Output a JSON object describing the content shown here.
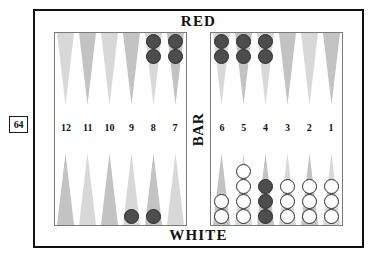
{
  "doubling_cube": {
    "value": "64",
    "name": "doubling-cube"
  },
  "frame": {
    "top_player_label": "RED",
    "bottom_player_label": "WHITE",
    "bar_label": "BAR"
  },
  "colors": {
    "red_checker": "#4d4d4d",
    "white_checker": "#ffffff",
    "checker_outline": "#2b2b2b",
    "point_light": "#d8d8d8",
    "point_dark": "#c3c3c3",
    "frame_border": "#111111",
    "board_border": "#7a7a7a",
    "background": "#ffffff"
  },
  "left_half": {
    "points": [
      {
        "number": "12",
        "shade": "light",
        "top_checkers": {
          "color": "red",
          "count": 0
        },
        "bottom_checkers": {
          "color": "red",
          "count": 0
        }
      },
      {
        "number": "11",
        "shade": "dark",
        "top_checkers": {
          "color": "red",
          "count": 0
        },
        "bottom_checkers": {
          "color": "red",
          "count": 0
        }
      },
      {
        "number": "10",
        "shade": "light",
        "top_checkers": {
          "color": "red",
          "count": 0
        },
        "bottom_checkers": {
          "color": "red",
          "count": 0
        }
      },
      {
        "number": "9",
        "shade": "dark",
        "top_checkers": {
          "color": "red",
          "count": 0
        },
        "bottom_checkers": {
          "color": "red",
          "count": 1
        }
      },
      {
        "number": "8",
        "shade": "light",
        "top_checkers": {
          "color": "red",
          "count": 2
        },
        "bottom_checkers": {
          "color": "red",
          "count": 1
        }
      },
      {
        "number": "7",
        "shade": "dark",
        "top_checkers": {
          "color": "red",
          "count": 2
        },
        "bottom_checkers": {
          "color": "red",
          "count": 0
        }
      }
    ]
  },
  "right_half": {
    "points": [
      {
        "number": "6",
        "shade": "light",
        "top_checkers": {
          "color": "red",
          "count": 2
        },
        "bottom_checkers": {
          "color": "white",
          "count": 2
        }
      },
      {
        "number": "5",
        "shade": "dark",
        "top_checkers": {
          "color": "red",
          "count": 2
        },
        "bottom_checkers": {
          "color": "white",
          "count": 4
        }
      },
      {
        "number": "4",
        "shade": "light",
        "top_checkers": {
          "color": "red",
          "count": 2
        },
        "bottom_checkers": {
          "color": "red",
          "count": 3
        }
      },
      {
        "number": "3",
        "shade": "dark",
        "top_checkers": {
          "color": "red",
          "count": 0
        },
        "bottom_checkers": {
          "color": "white",
          "count": 3
        }
      },
      {
        "number": "2",
        "shade": "light",
        "top_checkers": {
          "color": "red",
          "count": 0
        },
        "bottom_checkers": {
          "color": "white",
          "count": 3
        }
      },
      {
        "number": "1",
        "shade": "dark",
        "top_checkers": {
          "color": "red",
          "count": 0
        },
        "bottom_checkers": {
          "color": "white",
          "count": 3
        }
      }
    ]
  }
}
